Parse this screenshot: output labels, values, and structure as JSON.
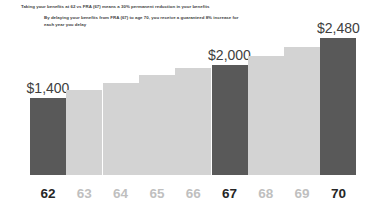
{
  "notes": {
    "line1": "Taking your benefits at 62 vs FRA (67) means a 30% permanent reduction in your benefits",
    "line2": "By delaying your benefits from FRA (67) to age 70, you receive a guaranteed 8% increase for",
    "line3": "each year you delay"
  },
  "colors": {
    "bar_highlight": "#595959",
    "bar_normal": "#d3d3d3",
    "label_emph": "#262626",
    "label_muted": "#bfbfbf",
    "note_text": "#3f3f3f"
  },
  "chart_data": {
    "type": "bar",
    "title": "",
    "xlabel": "",
    "ylabel": "",
    "grid": false,
    "legend": "none",
    "ylim": [
      0,
      2600
    ],
    "categories": [
      "62",
      "63",
      "64",
      "65",
      "66",
      "67",
      "68",
      "69",
      "70"
    ],
    "values": [
      1400,
      1535,
      1670,
      1805,
      1935,
      2000,
      2160,
      2320,
      2480
    ],
    "value_labels": [
      "$1,400",
      "",
      "",
      "",
      "",
      "$2,000",
      "",
      "",
      "$2,480"
    ],
    "highlighted": [
      true,
      false,
      false,
      false,
      false,
      true,
      false,
      false,
      true
    ],
    "category_emphasis": [
      true,
      false,
      false,
      false,
      false,
      true,
      false,
      false,
      true
    ],
    "bars": [
      {
        "category": "62",
        "value": 1400,
        "label": "$1,400",
        "highlight": true,
        "emph": true
      },
      {
        "category": "63",
        "value": 1535,
        "label": "",
        "highlight": false,
        "emph": false
      },
      {
        "category": "64",
        "value": 1670,
        "label": "",
        "highlight": false,
        "emph": false
      },
      {
        "category": "65",
        "value": 1805,
        "label": "",
        "highlight": false,
        "emph": false
      },
      {
        "category": "66",
        "value": 1935,
        "label": "",
        "highlight": false,
        "emph": false
      },
      {
        "category": "67",
        "value": 2000,
        "label": "$2,000",
        "highlight": true,
        "emph": true
      },
      {
        "category": "68",
        "value": 2160,
        "label": "",
        "highlight": false,
        "emph": false
      },
      {
        "category": "69",
        "value": 2320,
        "label": "",
        "highlight": false,
        "emph": false
      },
      {
        "category": "70",
        "value": 2480,
        "label": "$2,480",
        "highlight": true,
        "emph": true
      }
    ]
  }
}
